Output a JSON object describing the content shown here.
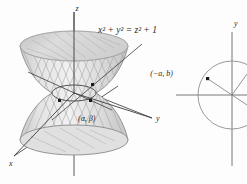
{
  "figure": {
    "background_color": "#fdfdfd",
    "panels": [
      {
        "id": "hyperboloid-panel",
        "name": "hyperboloid-of-one-sheet",
        "equation_label": "x² + y² = z² + 1",
        "axes": [
          {
            "name": "z-axis",
            "label": "z"
          },
          {
            "name": "y-axis",
            "label": "y"
          },
          {
            "name": "x-axis",
            "label": "x"
          }
        ],
        "point_label": "(α, β)",
        "marked_point_count": "3",
        "surface_fill": "#d8d8d8",
        "surface_stroke": "#8a8a8a",
        "ruling_stroke": "#9a9a9a",
        "axis_stroke": "#5a5a5a"
      },
      {
        "id": "circle-panel",
        "name": "unit-circle-diagram",
        "axes": [
          {
            "name": "y-axis",
            "label": "y"
          },
          {
            "name": "x-axis",
            "label": ""
          }
        ],
        "point_label": "(−a, b)",
        "circle_stroke": "#8f8f8f",
        "axis_stroke": "#6a6a6a",
        "radius_stroke": "#8a8a8a"
      }
    ]
  }
}
